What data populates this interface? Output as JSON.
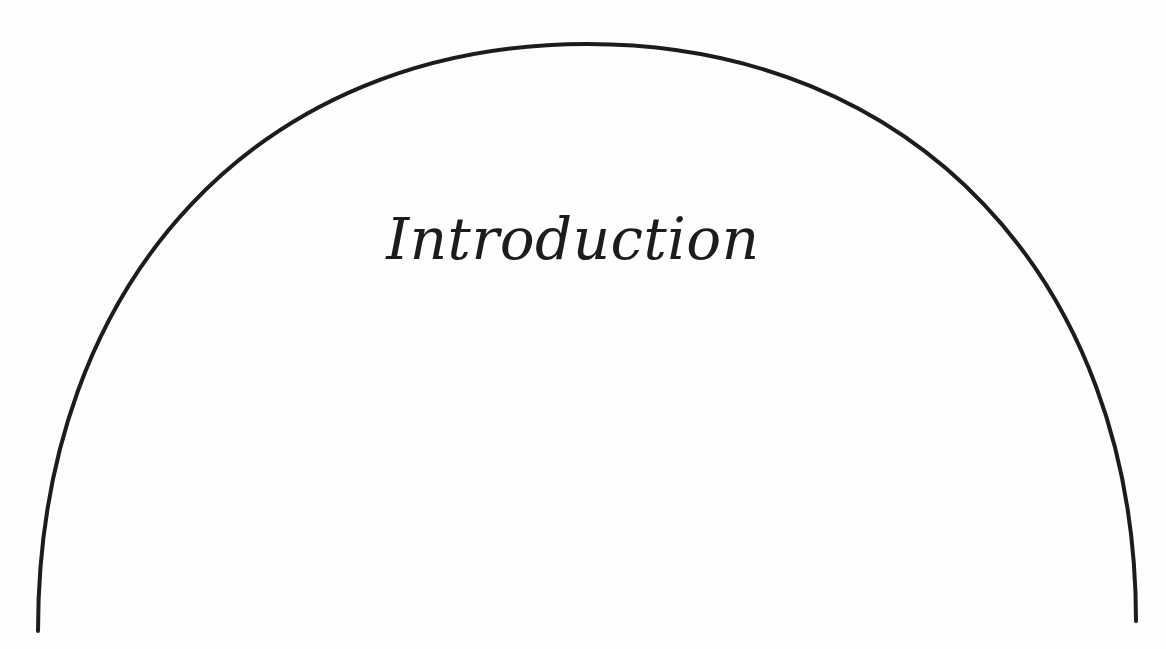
{
  "page": {
    "title": "Introduction",
    "ornament": "semicircular-arc",
    "colors": {
      "background": "#fefefe",
      "ink": "#1c1c1c"
    }
  }
}
